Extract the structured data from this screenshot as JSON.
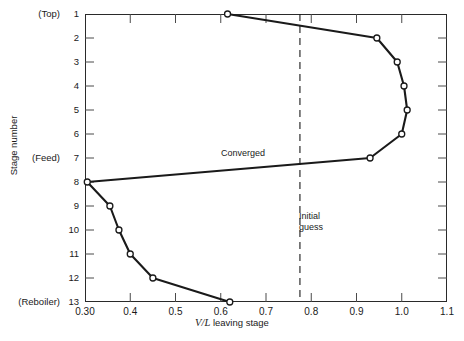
{
  "chart_data": {
    "type": "line",
    "title": "",
    "xlabel": "V/L leaving stage",
    "ylabel": "Stage number",
    "xlim": [
      0.3,
      1.1
    ],
    "ylim": [
      1,
      13
    ],
    "grid": false,
    "legend": null,
    "x_ticks": [
      "0.30",
      "0.4",
      "0.5",
      "0.6",
      "0.7",
      "0.8",
      "0.9",
      "1.0",
      "1.1"
    ],
    "x_tick_values": [
      0.3,
      0.4,
      0.5,
      0.6,
      0.7,
      0.8,
      0.9,
      1.0,
      1.1
    ],
    "y_ticks": [
      "1",
      "2",
      "3",
      "4",
      "5",
      "6",
      "7",
      "8",
      "9",
      "10",
      "11",
      "12",
      "13"
    ],
    "y_tick_values": [
      1,
      2,
      3,
      4,
      5,
      6,
      7,
      8,
      9,
      10,
      11,
      12,
      13
    ],
    "y_tick_annotations": {
      "1": "(Top)",
      "7": "(Feed)",
      "13": "(Reboiler)"
    },
    "series": [
      {
        "name": "Converged",
        "marker": "open-circle",
        "line_style": "solid",
        "color": "#1a1a1a",
        "points": [
          {
            "stage": 1,
            "vl": 0.615
          },
          {
            "stage": 2,
            "vl": 0.945
          },
          {
            "stage": 3,
            "vl": 0.99
          },
          {
            "stage": 4,
            "vl": 1.005
          },
          {
            "stage": 5,
            "vl": 1.012
          },
          {
            "stage": 6,
            "vl": 1.0
          },
          {
            "stage": 7,
            "vl": 0.93
          },
          {
            "stage": 8,
            "vl": 0.305
          },
          {
            "stage": 9,
            "vl": 0.355
          },
          {
            "stage": 10,
            "vl": 0.375
          },
          {
            "stage": 11,
            "vl": 0.4
          },
          {
            "stage": 12,
            "vl": 0.45
          },
          {
            "stage": 13,
            "vl": 0.62
          }
        ]
      }
    ],
    "annotations": [
      {
        "name": "converged",
        "text": "Converged",
        "type": "text-label"
      },
      {
        "name": "initial-guess",
        "text_line_1": "Initial",
        "text_line_2": "guess",
        "type": "vertical-dashed-line",
        "vl": 0.775,
        "line_style": "dashed",
        "color": "#1a1a1a"
      }
    ]
  },
  "axis": {
    "x_title_italic": "V/L",
    "x_title_rest": " leaving stage",
    "y_title": "Stage number"
  },
  "colors": {
    "frame": "#2a2a2a",
    "line": "#1a1a1a",
    "marker_fill": "#ffffff",
    "background": "#ffffff"
  }
}
